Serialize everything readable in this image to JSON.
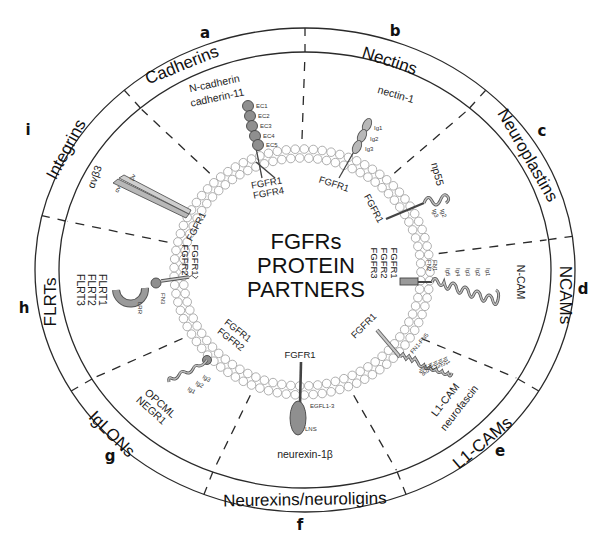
{
  "diagram": {
    "title_lines": [
      "FGFRs",
      "PROTEIN",
      "PARTNERS"
    ],
    "colors": {
      "line": "#2a2a2a",
      "domain_dark": "#8f8f8f",
      "domain_light": "#b8b8b8",
      "lipid_stroke": "#9a9a9a",
      "background": "#ffffff"
    },
    "categories": [
      {
        "letter": "a",
        "name": "Cadherins",
        "proteins": [
          "N-cadherin",
          "cadherin-11"
        ],
        "receptors": [
          "FGFR1",
          "FGFR4"
        ],
        "domains": [
          "EC1",
          "EC2",
          "EC3",
          "EC4",
          "EC5"
        ]
      },
      {
        "letter": "b",
        "name": "Nectins",
        "proteins": [
          "nectin-1"
        ],
        "receptors": [
          "FGFR1"
        ],
        "domains": [
          "Ig1",
          "Ig2",
          "Ig3"
        ]
      },
      {
        "letter": "c",
        "name": "Neuroplastins",
        "proteins": [
          "np55"
        ],
        "receptors": [
          "FGFR1"
        ],
        "domains": [
          "Ig2",
          "Ig3"
        ]
      },
      {
        "letter": "d",
        "name": "NCAMs",
        "proteins": [
          "N-CAM"
        ],
        "receptors": [
          "FGFR1",
          "FGFR2",
          "FGFR3"
        ],
        "domains": [
          "FN1",
          "FN2",
          "Ig1",
          "Ig2",
          "Ig3",
          "Ig4",
          "Ig5"
        ]
      },
      {
        "letter": "e",
        "name": "L1-CAMs",
        "proteins": [
          "L1-CAM",
          "neurofascin"
        ],
        "receptors": [
          "FGFR1"
        ],
        "domains": [
          "FN1-FN5",
          "Ig6",
          "Ig5",
          "Ig4",
          "Ig3",
          "Ig2",
          "Ig1"
        ]
      },
      {
        "letter": "f",
        "name": "Neurexins/neuroligins",
        "proteins": [
          "neurexin-1β"
        ],
        "receptors": [
          "FGFR1"
        ],
        "domains": [
          "EGFL1-3",
          "LNS"
        ]
      },
      {
        "letter": "g",
        "name": "IgLONs",
        "proteins": [
          "OPCML",
          "NEGR1"
        ],
        "receptors": [
          "FGFR1",
          "FGFR2"
        ],
        "domains": [
          "Ig3",
          "Ig2",
          "Ig1"
        ]
      },
      {
        "letter": "h",
        "name": "FLRTs",
        "proteins": [
          "FLRT1",
          "FLRT2",
          "FLRT3"
        ],
        "receptors": [
          "FGFR1",
          "FGFR2"
        ],
        "domains": [
          "FN3",
          "LRR"
        ]
      },
      {
        "letter": "i",
        "name": "Integrins",
        "proteins": [
          "αvβ3"
        ],
        "receptors": [
          "FGFR1"
        ],
        "domains": [
          "αv",
          "βv"
        ]
      }
    ]
  }
}
